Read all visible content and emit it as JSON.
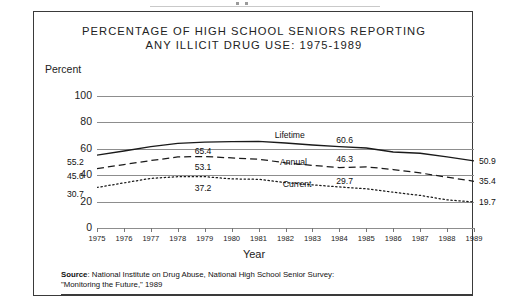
{
  "title_line1": "PERCENTAGE OF HIGH SCHOOL SENIORS REPORTING",
  "title_line2": "ANY ILLICIT DRUG USE: 1975-1989",
  "source": {
    "prefix": "Source",
    "line1": ": National Institute on Drug Abuse, National High School Senior Survey:",
    "line2": "\"Monitoring the Future,\" 1989"
  },
  "chart_data": {
    "type": "line",
    "title": "PERCENTAGE OF HIGH SCHOOL SENIORS REPORTING ANY ILLICIT DRUG USE: 1975-1989",
    "xlabel": "Year",
    "ylabel": "Percent",
    "ylim": [
      0,
      100
    ],
    "yticks": [
      0,
      20,
      40,
      60,
      80,
      100
    ],
    "ytick_labels": [
      "0",
      "20",
      "40",
      "60",
      "80",
      "100"
    ],
    "grid": true,
    "legend": "inline-labels",
    "x": [
      1975,
      1976,
      1977,
      1978,
      1979,
      1980,
      1981,
      1982,
      1983,
      1984,
      1985,
      1986,
      1987,
      1988,
      1989
    ],
    "xtick_labels": [
      "1975",
      "1976",
      "1977",
      "1978",
      "1979",
      "1980",
      "1981",
      "1982",
      "1983",
      "1984",
      "1985",
      "1986",
      "1987",
      "1988",
      "1989"
    ],
    "series": [
      {
        "name": "Lifetime",
        "style": "solid",
        "values": [
          55.2,
          58.3,
          61.6,
          64.1,
          65.1,
          65.4,
          65.6,
          64.4,
          62.9,
          61.6,
          60.6,
          57.6,
          56.6,
          53.9,
          50.9
        ],
        "labels": [
          {
            "x": 1975,
            "value": 55.2,
            "text": "55.2"
          },
          {
            "x": 1980,
            "value": 65.4,
            "text": "65.4"
          },
          {
            "x": 1985,
            "value": 60.6,
            "text": "60.6"
          },
          {
            "x": 1989,
            "value": 50.9,
            "text": "50.9"
          }
        ]
      },
      {
        "name": "Annual",
        "style": "dashed",
        "values": [
          45.0,
          48.1,
          51.1,
          53.8,
          54.2,
          53.1,
          52.1,
          49.4,
          47.4,
          45.8,
          46.3,
          44.3,
          41.7,
          38.5,
          35.4
        ],
        "labels": [
          {
            "x": 1975,
            "value": 45.0,
            "text": "45.0"
          },
          {
            "x": 1980,
            "value": 53.1,
            "text": "53.1"
          },
          {
            "x": 1985,
            "value": 46.3,
            "text": "46.3"
          },
          {
            "x": 1989,
            "value": 35.4,
            "text": "35.4"
          }
        ]
      },
      {
        "name": "Current",
        "style": "dotted",
        "values": [
          30.7,
          34.2,
          37.6,
          38.9,
          38.9,
          37.2,
          36.9,
          34.4,
          32.7,
          31.1,
          29.7,
          27.1,
          24.7,
          21.3,
          19.7
        ],
        "labels": [
          {
            "x": 1975,
            "value": 30.7,
            "text": "30.7"
          },
          {
            "x": 1980,
            "value": 37.2,
            "text": "37.2"
          },
          {
            "x": 1985,
            "value": 29.7,
            "text": "29.7"
          },
          {
            "x": 1989,
            "value": 19.7,
            "text": "19.7"
          }
        ]
      }
    ],
    "series_labels": [
      {
        "name": "Lifetime",
        "text": "Lifetime"
      },
      {
        "name": "Annual",
        "text": "Annual"
      },
      {
        "name": "Current",
        "text": "Current"
      }
    ]
  }
}
